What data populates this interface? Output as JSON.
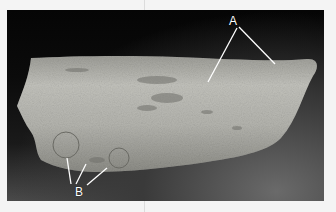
{
  "figure": {
    "background_color": "#f4f4f4",
    "photo_background": "#050505",
    "bone_color": "#b9b9b3",
    "annotations": [
      {
        "label": "A",
        "arrow_count": 2
      },
      {
        "label": "B",
        "arrow_count": 3
      }
    ]
  }
}
